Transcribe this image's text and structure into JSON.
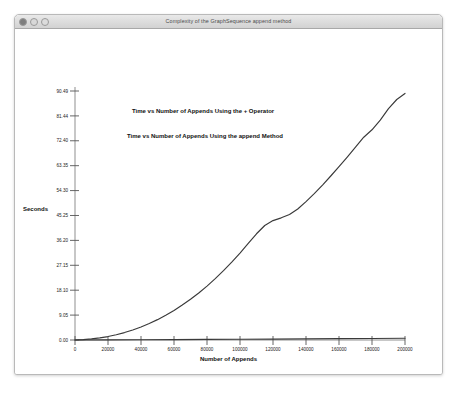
{
  "window": {
    "title": "Complexity of the GraphSequence append method",
    "controls": [
      {
        "name": "close-button",
        "label": "close"
      },
      {
        "name": "minimize-button",
        "label": "minimize"
      },
      {
        "name": "zoom-button",
        "label": "zoom"
      }
    ]
  },
  "chart_data": {
    "type": "line",
    "title": "",
    "xlabel": "Number of Appends",
    "ylabel": "Seconds",
    "grid": false,
    "legend_position": "in-plot annotations",
    "xlim": [
      0,
      200000
    ],
    "ylim": [
      0,
      90.49
    ],
    "xticks": [
      0,
      20000,
      40000,
      60000,
      80000,
      100000,
      120000,
      140000,
      160000,
      180000,
      200000
    ],
    "xtick_labels": [
      "0",
      "20000",
      "40000",
      "60000",
      "80000",
      "100000",
      "120000",
      "140000",
      "160000",
      "180000",
      "200000"
    ],
    "yticks": [
      0.0,
      9.05,
      18.1,
      27.15,
      36.2,
      45.25,
      54.3,
      63.35,
      72.4,
      81.44,
      90.49
    ],
    "ytick_labels": [
      "0.00",
      "9.05",
      "18.10",
      "27.15",
      "36.20",
      "45.25",
      "54.30",
      "63.35",
      "72.40",
      "81.44",
      "90.49"
    ],
    "annotations": [
      "Time vs Number of Appends Using the + Operator",
      "Time vs Number of Appends Using the append Method"
    ],
    "series": [
      {
        "name": "Time vs Number of Appends Using the + Operator",
        "color": "#3a3a3a",
        "x": [
          0,
          5000,
          10000,
          15000,
          20000,
          25000,
          30000,
          35000,
          40000,
          45000,
          50000,
          55000,
          60000,
          65000,
          70000,
          75000,
          80000,
          85000,
          90000,
          95000,
          100000,
          105000,
          110000,
          115000,
          120000,
          125000,
          130000,
          135000,
          140000,
          145000,
          150000,
          155000,
          160000,
          165000,
          170000,
          175000,
          180000,
          185000,
          190000,
          195000,
          200000
        ],
        "values": [
          0.0,
          0.15,
          0.4,
          0.75,
          1.25,
          1.9,
          2.7,
          3.65,
          4.75,
          6.0,
          7.4,
          9.0,
          10.75,
          12.7,
          14.8,
          17.1,
          19.6,
          22.3,
          25.2,
          28.3,
          31.6,
          35.1,
          38.6,
          41.6,
          43.4,
          44.4,
          45.6,
          47.6,
          50.3,
          53.2,
          56.3,
          59.6,
          63.0,
          66.5,
          70.1,
          73.7,
          76.4,
          79.9,
          84.1,
          87.4,
          89.6
        ]
      },
      {
        "name": "Time vs Number of Appends Using the append Method",
        "color": "#3a3a3a",
        "x": [
          0,
          20000,
          40000,
          60000,
          80000,
          100000,
          120000,
          140000,
          160000,
          180000,
          200000
        ],
        "values": [
          0.0,
          0.05,
          0.1,
          0.16,
          0.22,
          0.28,
          0.34,
          0.41,
          0.48,
          0.56,
          0.65
        ]
      }
    ]
  }
}
